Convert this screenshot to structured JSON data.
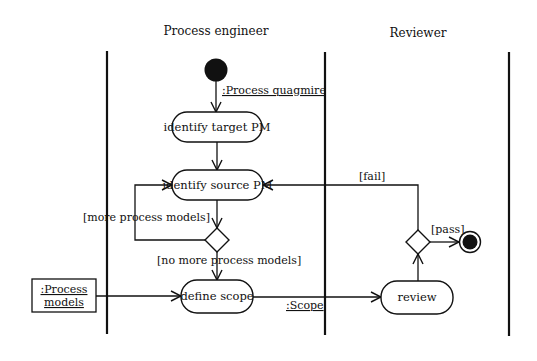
{
  "diagram": {
    "type": "UML activity diagram",
    "colors": {
      "stroke": "#111111",
      "background": "#ffffff"
    },
    "swimlanes": [
      {
        "id": "lane-process-engineer",
        "title": "Process engineer"
      },
      {
        "id": "lane-reviewer",
        "title": "Reviewer"
      }
    ],
    "nodes": {
      "initial": {
        "kind": "initial-node"
      },
      "identify_target": {
        "kind": "action",
        "label": "identify target PM"
      },
      "identify_source": {
        "kind": "action",
        "label": "identify source PM"
      },
      "decision_models": {
        "kind": "decision-node"
      },
      "define_scope": {
        "kind": "action",
        "label": "define scope"
      },
      "process_models": {
        "kind": "object-node",
        "label_line1": ":Process",
        "label_line2": "models"
      },
      "review": {
        "kind": "action",
        "label": "review"
      },
      "decision_review": {
        "kind": "decision-node"
      },
      "final": {
        "kind": "final-node"
      }
    },
    "edges": [
      {
        "from": "initial",
        "to": "identify_target",
        "label": ":Process quagmire"
      },
      {
        "from": "identify_target",
        "to": "identify_source",
        "label": ""
      },
      {
        "from": "identify_source",
        "to": "decision_models",
        "label": ""
      },
      {
        "from": "decision_models",
        "to": "identify_source",
        "label": "[more process models]"
      },
      {
        "from": "decision_models",
        "to": "define_scope",
        "label": "[no more process models]"
      },
      {
        "from": "process_models",
        "to": "define_scope",
        "label": ""
      },
      {
        "from": "define_scope",
        "to": "review",
        "label": ":Scope"
      },
      {
        "from": "review",
        "to": "decision_review",
        "label": ""
      },
      {
        "from": "decision_review",
        "to": "identify_source",
        "label": "[fail]"
      },
      {
        "from": "decision_review",
        "to": "final",
        "label": "[pass]"
      }
    ],
    "labels": {
      "process_quagmire": ":Process quagmire",
      "more_models": "[more process models]",
      "no_more_models": "[no more process models]",
      "scope": ":Scope",
      "fail": "[fail]",
      "pass": "[pass]"
    }
  }
}
